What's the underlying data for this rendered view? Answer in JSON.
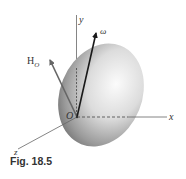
{
  "figure": {
    "caption": "Fig. 18.5",
    "labels": {
      "y_axis": "y",
      "x_axis": "x",
      "z_axis": "z",
      "origin": "O",
      "omega": "ω",
      "angular_momentum_main": "H",
      "angular_momentum_sub": "O"
    },
    "colors": {
      "axis": "#555555",
      "omega_arrow": "#1a1a1a",
      "h_arrow": "#666666",
      "body_light": "#f4f4f4",
      "body_dark": "#6e6e6e"
    }
  }
}
